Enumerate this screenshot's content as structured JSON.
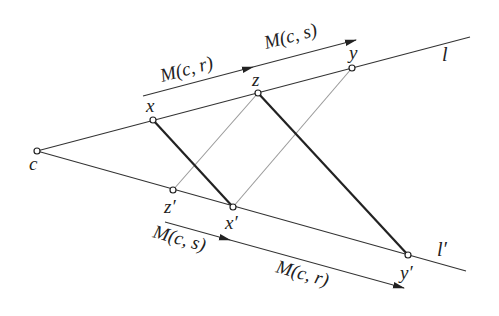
{
  "diagram": {
    "points": {
      "c": {
        "label": "c",
        "x": 37,
        "y": 151
      },
      "x": {
        "label": "x",
        "x": 153,
        "y": 120
      },
      "z": {
        "label": "z",
        "x": 258,
        "y": 93
      },
      "y": {
        "label": "y",
        "x": 352,
        "y": 68
      },
      "z_prime": {
        "label": "z′",
        "x": 173,
        "y": 190
      },
      "x_prime": {
        "label": "x′",
        "x": 233,
        "y": 207
      },
      "y_prime": {
        "label": "y′",
        "x": 408,
        "y": 255
      }
    },
    "lines": {
      "l": {
        "label": "l"
      },
      "l_prime": {
        "label": "l′"
      }
    },
    "arrows": {
      "top_first": {
        "label": "M(c, r)"
      },
      "top_second": {
        "label": "M(c, s)"
      },
      "bottom_first": {
        "label": "M(c, s)"
      },
      "bottom_second": {
        "label": "M(c, r)"
      }
    },
    "segments": {
      "thick": [
        "x–x′",
        "z–y′"
      ],
      "thin": [
        "z–z′",
        "y–x′"
      ]
    }
  }
}
